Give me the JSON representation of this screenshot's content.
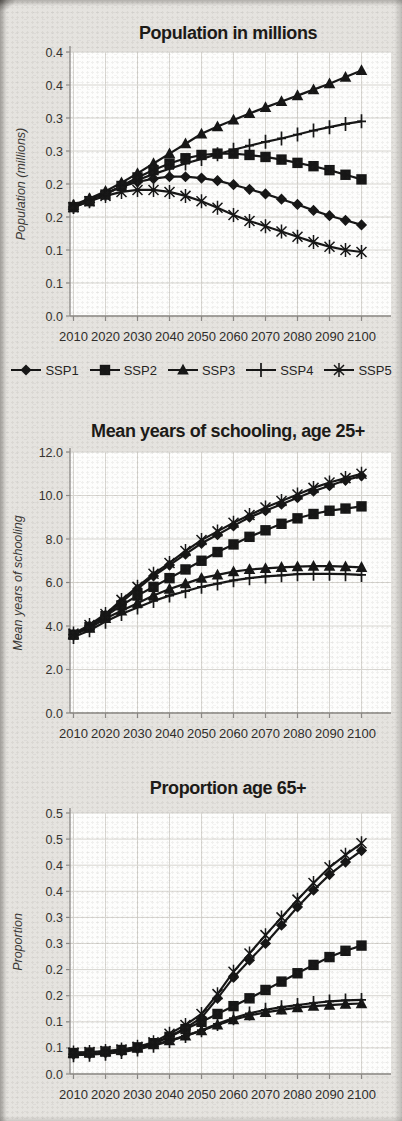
{
  "style": {
    "page_bg": "#e5e3df",
    "plot_bg": "#fdfdfc",
    "grid_color": "#d7d5d0",
    "axis_color": "#8b8985",
    "series_color": "#161616",
    "title_color": "#1c1a17"
  },
  "chart_data": [
    {
      "type": "line",
      "title": "Population in millions",
      "ylabel": "Population (millions)",
      "ylim": [
        0,
        0.4
      ],
      "y_tick_labels": [
        "0.4",
        "0.4",
        "0.3",
        "0.3",
        "0.2",
        "0.2",
        "0.1",
        "0.1",
        "0.0"
      ],
      "x": [
        2010,
        2015,
        2020,
        2025,
        2030,
        2035,
        2040,
        2045,
        2050,
        2055,
        2060,
        2065,
        2070,
        2075,
        2080,
        2085,
        2090,
        2095,
        2100
      ],
      "x_tick_labels": [
        "2010",
        "2020",
        "2030",
        "2040",
        "2050",
        "2060",
        "2070",
        "2080",
        "2090",
        "2100"
      ],
      "grid": true,
      "legend_position": "below",
      "series": [
        {
          "name": "SSP1",
          "marker": "diamond",
          "values": [
            0.165,
            0.176,
            0.186,
            0.196,
            0.203,
            0.208,
            0.211,
            0.211,
            0.209,
            0.205,
            0.199,
            0.192,
            0.185,
            0.177,
            0.169,
            0.16,
            0.152,
            0.145,
            0.138
          ]
        },
        {
          "name": "SSP2",
          "marker": "square",
          "values": [
            0.165,
            0.174,
            0.184,
            0.197,
            0.21,
            0.221,
            0.231,
            0.239,
            0.244,
            0.246,
            0.246,
            0.244,
            0.241,
            0.237,
            0.232,
            0.227,
            0.221,
            0.214,
            0.207
          ]
        },
        {
          "name": "SSP3",
          "marker": "triangle",
          "values": [
            0.168,
            0.178,
            0.189,
            0.202,
            0.216,
            0.231,
            0.246,
            0.261,
            0.276,
            0.287,
            0.297,
            0.307,
            0.316,
            0.325,
            0.334,
            0.343,
            0.352,
            0.362,
            0.372
          ]
        },
        {
          "name": "SSP4",
          "marker": "plus",
          "values": [
            0.166,
            0.175,
            0.185,
            0.196,
            0.206,
            0.215,
            0.223,
            0.231,
            0.238,
            0.245,
            0.252,
            0.258,
            0.264,
            0.269,
            0.275,
            0.281,
            0.286,
            0.291,
            0.295
          ]
        },
        {
          "name": "SSP5",
          "marker": "asterisk",
          "values": [
            0.165,
            0.174,
            0.182,
            0.188,
            0.191,
            0.191,
            0.188,
            0.182,
            0.174,
            0.164,
            0.153,
            0.144,
            0.136,
            0.128,
            0.12,
            0.112,
            0.105,
            0.1,
            0.097
          ]
        }
      ]
    },
    {
      "type": "line",
      "title": "Mean years of schooling, age 25+",
      "ylabel": "Mean years of schooling",
      "ylim": [
        0,
        12
      ],
      "y_tick_labels": [
        "12.0",
        "10.0",
        "8.0",
        "6.0",
        "4.0",
        "2.0",
        "0.0"
      ],
      "x": [
        2010,
        2015,
        2020,
        2025,
        2030,
        2035,
        2040,
        2045,
        2050,
        2055,
        2060,
        2065,
        2070,
        2075,
        2080,
        2085,
        2090,
        2095,
        2100
      ],
      "x_tick_labels": [
        "2010",
        "2020",
        "2030",
        "2040",
        "2050",
        "2060",
        "2070",
        "2080",
        "2090",
        "2100"
      ],
      "grid": true,
      "legend_position": "none",
      "series": [
        {
          "name": "SSP1",
          "marker": "diamond",
          "values": [
            3.6,
            4.0,
            4.5,
            5.1,
            5.7,
            6.3,
            6.8,
            7.3,
            7.8,
            8.2,
            8.6,
            9.0,
            9.3,
            9.6,
            9.9,
            10.2,
            10.45,
            10.7,
            10.9
          ]
        },
        {
          "name": "SSP2",
          "marker": "square",
          "values": [
            3.6,
            3.95,
            4.45,
            4.95,
            5.4,
            5.8,
            6.2,
            6.6,
            7.0,
            7.4,
            7.75,
            8.1,
            8.4,
            8.7,
            8.95,
            9.15,
            9.3,
            9.4,
            9.5
          ]
        },
        {
          "name": "SSP3",
          "marker": "triangle",
          "values": [
            3.6,
            3.9,
            4.35,
            4.7,
            5.05,
            5.4,
            5.7,
            5.95,
            6.2,
            6.35,
            6.5,
            6.6,
            6.65,
            6.7,
            6.73,
            6.75,
            6.75,
            6.73,
            6.7
          ]
        },
        {
          "name": "SSP4",
          "marker": "plus",
          "values": [
            3.5,
            3.8,
            4.2,
            4.55,
            4.85,
            5.15,
            5.4,
            5.6,
            5.8,
            5.95,
            6.1,
            6.2,
            6.28,
            6.33,
            6.38,
            6.4,
            6.4,
            6.38,
            6.35
          ]
        },
        {
          "name": "SSP5",
          "marker": "asterisk",
          "values": [
            3.65,
            4.05,
            4.55,
            5.2,
            5.8,
            6.4,
            6.9,
            7.45,
            7.95,
            8.35,
            8.75,
            9.1,
            9.45,
            9.75,
            10.05,
            10.35,
            10.6,
            10.8,
            11.0
          ]
        }
      ]
    },
    {
      "type": "line",
      "title": "Proportion age 65+",
      "ylabel": "Proportion",
      "ylim": [
        0,
        0.5
      ],
      "y_tick_labels": [
        "0.5",
        "0.5",
        "0.4",
        "0.4",
        "0.3",
        "0.3",
        "0.2",
        "0.2",
        "0.1",
        "0.1",
        "0.0"
      ],
      "x": [
        2010,
        2015,
        2020,
        2025,
        2030,
        2035,
        2040,
        2045,
        2050,
        2055,
        2060,
        2065,
        2070,
        2075,
        2080,
        2085,
        2090,
        2095,
        2100
      ],
      "x_tick_labels": [
        "2010",
        "2020",
        "2030",
        "2040",
        "2050",
        "2060",
        "2070",
        "2080",
        "2090",
        "2100"
      ],
      "grid": true,
      "legend_position": "none",
      "series": [
        {
          "name": "SSP1",
          "marker": "diamond",
          "values": [
            0.038,
            0.039,
            0.041,
            0.044,
            0.049,
            0.057,
            0.072,
            0.088,
            0.108,
            0.145,
            0.185,
            0.218,
            0.25,
            0.285,
            0.32,
            0.352,
            0.382,
            0.406,
            0.428
          ]
        },
        {
          "name": "SSP2",
          "marker": "square",
          "values": [
            0.04,
            0.041,
            0.043,
            0.046,
            0.051,
            0.059,
            0.071,
            0.086,
            0.1,
            0.115,
            0.13,
            0.145,
            0.161,
            0.177,
            0.193,
            0.209,
            0.224,
            0.236,
            0.246
          ]
        },
        {
          "name": "SSP3",
          "marker": "triangle",
          "values": [
            0.04,
            0.041,
            0.043,
            0.046,
            0.05,
            0.056,
            0.064,
            0.073,
            0.083,
            0.094,
            0.104,
            0.112,
            0.118,
            0.123,
            0.127,
            0.13,
            0.132,
            0.134,
            0.135
          ]
        },
        {
          "name": "SSP4",
          "marker": "plus",
          "values": [
            0.036,
            0.037,
            0.039,
            0.042,
            0.047,
            0.054,
            0.063,
            0.073,
            0.084,
            0.096,
            0.107,
            0.116,
            0.123,
            0.128,
            0.132,
            0.136,
            0.139,
            0.141,
            0.142
          ]
        },
        {
          "name": "SSP5",
          "marker": "asterisk",
          "values": [
            0.041,
            0.042,
            0.044,
            0.047,
            0.052,
            0.061,
            0.077,
            0.094,
            0.115,
            0.153,
            0.196,
            0.231,
            0.266,
            0.3,
            0.334,
            0.366,
            0.396,
            0.42,
            0.442
          ]
        }
      ]
    }
  ]
}
